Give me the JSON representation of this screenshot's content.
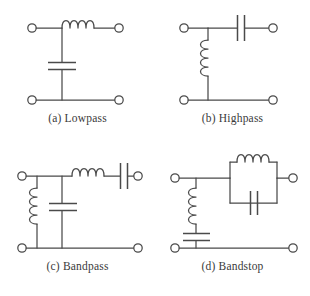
{
  "figure": {
    "background_color": "#ffffff",
    "line_color": "#4a4a4a",
    "text_color": "#3a3a3a",
    "panel_count": 4,
    "grid": "2x2"
  },
  "panels": [
    {
      "id": "a",
      "label": "(a)",
      "name": "Lowpass",
      "caption": "(a) Lowpass",
      "topology": "L-section: series inductor, shunt capacitor",
      "components": [
        {
          "ref": "L1",
          "type": "inductor",
          "placement": "series-top",
          "orientation": "horizontal",
          "turns": 4
        },
        {
          "ref": "C1",
          "type": "capacitor",
          "placement": "shunt",
          "orientation": "vertical",
          "plates": 2
        }
      ],
      "terminals": [
        "input-top-left",
        "output-top-right",
        "input-bottom-left",
        "output-bottom-right"
      ]
    },
    {
      "id": "b",
      "label": "(b)",
      "name": "Highpass",
      "caption": "(b) Highpass",
      "topology": "L-section: series capacitor, shunt inductor",
      "components": [
        {
          "ref": "C1",
          "type": "capacitor",
          "placement": "series-top",
          "orientation": "horizontal",
          "plates": 2
        },
        {
          "ref": "L1",
          "type": "inductor",
          "placement": "shunt",
          "orientation": "vertical",
          "turns": 3
        }
      ],
      "terminals": [
        "input-top-left",
        "output-top-right",
        "input-bottom-left",
        "output-bottom-right"
      ]
    },
    {
      "id": "c",
      "label": "(c)",
      "name": "Bandpass",
      "caption": "(c) Bandpass",
      "topology": "Series L-C in series arm; parallel L, C in shunt arms",
      "components": [
        {
          "ref": "L1",
          "type": "inductor",
          "placement": "shunt-left",
          "orientation": "vertical",
          "turns": 3
        },
        {
          "ref": "C1",
          "type": "capacitor",
          "placement": "shunt-middle",
          "orientation": "vertical",
          "plates": 2
        },
        {
          "ref": "L2",
          "type": "inductor",
          "placement": "series-top",
          "orientation": "horizontal",
          "turns": 4
        },
        {
          "ref": "C2",
          "type": "capacitor",
          "placement": "series-top-right",
          "orientation": "horizontal",
          "plates": 2
        }
      ],
      "terminals": [
        "input-top-left",
        "output-top-right",
        "input-bottom-left",
        "output-bottom-right"
      ]
    },
    {
      "id": "d",
      "label": "(d)",
      "name": "Bandstop",
      "caption": "(d) Bandstop",
      "topology": "Parallel L||C tank in series arm; series L-C in shunt arm",
      "components": [
        {
          "ref": "L1",
          "type": "inductor",
          "placement": "shunt",
          "orientation": "vertical",
          "turns": 3
        },
        {
          "ref": "C1",
          "type": "capacitor",
          "placement": "shunt-bottom",
          "orientation": "horizontal",
          "plates": 2
        },
        {
          "ref": "L2",
          "type": "inductor",
          "placement": "tank-top-branch",
          "orientation": "horizontal",
          "turns": 4
        },
        {
          "ref": "C2",
          "type": "capacitor",
          "placement": "tank-bottom-branch",
          "orientation": "vertical",
          "plates": 2
        }
      ],
      "terminals": [
        "input-top-left",
        "output-top-right",
        "input-bottom-left",
        "output-bottom-right"
      ]
    }
  ]
}
